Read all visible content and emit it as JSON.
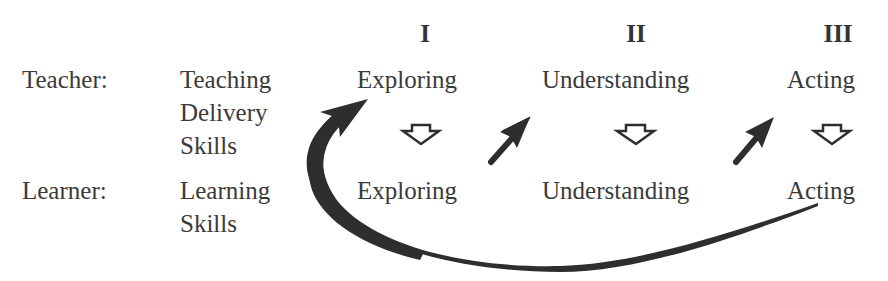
{
  "stages": [
    {
      "numeral": "I"
    },
    {
      "numeral": "II"
    },
    {
      "numeral": "III"
    }
  ],
  "teacher": {
    "role_label": "Teacher:",
    "skills_lines": [
      "Teaching",
      "Delivery",
      "Skills"
    ],
    "stages": [
      "Exploring",
      "Understanding",
      "Acting"
    ]
  },
  "learner": {
    "role_label": "Learner:",
    "skills_lines": [
      "Learning",
      "Skills"
    ],
    "stages": [
      "Exploring",
      "Understanding",
      "Acting"
    ]
  },
  "arrows": {
    "down_hollow": [
      "teacher-exploring-to-learner-exploring",
      "teacher-understanding-to-learner-understanding",
      "teacher-acting-to-learner-acting"
    ],
    "diagonal_solid": [
      "learner-exploring-to-teacher-understanding",
      "learner-understanding-to-teacher-acting"
    ],
    "feedback_loop": "learner-acting-to-teacher-exploring"
  },
  "colors": {
    "ink": "#2e2e2e",
    "text": "#3a3a3a",
    "background": "#ffffff"
  }
}
